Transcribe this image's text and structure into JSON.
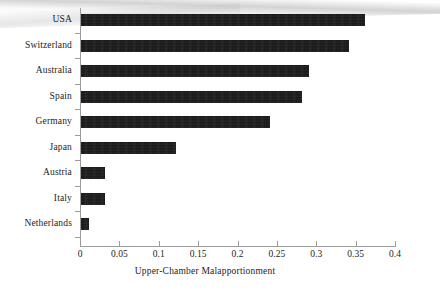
{
  "chart_data": {
    "type": "bar",
    "orientation": "horizontal",
    "title": "",
    "subtitle": "",
    "xlabel": "Upper-Chamber Malapportionment",
    "ylabel": "",
    "categories": [
      "USA",
      "Switzerland",
      "Australia",
      "Spain",
      "Germany",
      "Japan",
      "Austria",
      "Italy",
      "Netherlands"
    ],
    "values": [
      0.36,
      0.34,
      0.29,
      0.28,
      0.24,
      0.12,
      0.03,
      0.03,
      0.01
    ],
    "series": [
      {
        "name": "Upper-Chamber Malapportionment",
        "values": [
          0.36,
          0.34,
          0.29,
          0.28,
          0.24,
          0.12,
          0.03,
          0.03,
          0.01
        ]
      }
    ],
    "xlim": [
      0,
      0.4
    ],
    "xticks": [
      0,
      0.05,
      0.1,
      0.15,
      0.2,
      0.25,
      0.3,
      0.35,
      0.4
    ],
    "xtick_labels": [
      "0",
      "0.05",
      "0.1",
      "0.15",
      "0.2",
      "0.25",
      "0.3",
      "0.35",
      "0.4"
    ],
    "grid": false,
    "legend": false,
    "legend_position": "none",
    "bar_color": "#151515",
    "axis_color": "#9b9b9b",
    "background_color": "#ffffff",
    "annotations": []
  },
  "figure": {
    "page_background": "#ffffff",
    "artifact_note": "scan shadow"
  }
}
